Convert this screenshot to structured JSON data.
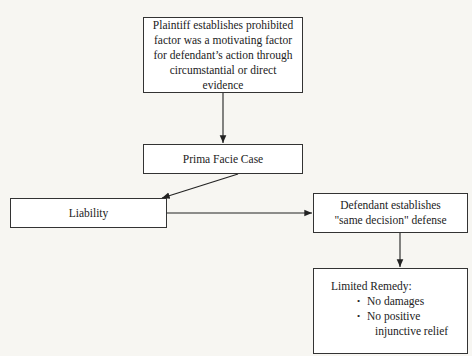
{
  "diagram": {
    "nodes": {
      "motivating": {
        "lines": [
          "Plaintiff establishes prohibited",
          "factor was a motivating factor",
          "for defendant’s action through",
          "circumstantial or direct",
          "evidence"
        ]
      },
      "prima_facie": {
        "label": "Prima Facie Case"
      },
      "liability": {
        "label": "Liability"
      },
      "same_decision": {
        "lines": [
          "Defendant establishes",
          "\"same decision\" defense"
        ]
      },
      "limited_remedy": {
        "title": "Limited Remedy:",
        "bullets": [
          "No damages",
          "No positive"
        ],
        "continuation": "injunctive relief"
      }
    },
    "edges": [
      {
        "from": "motivating",
        "to": "prima_facie"
      },
      {
        "from": "prima_facie",
        "to": "liability"
      },
      {
        "from": "liability",
        "to": "same_decision"
      },
      {
        "from": "same_decision",
        "to": "limited_remedy"
      }
    ]
  }
}
